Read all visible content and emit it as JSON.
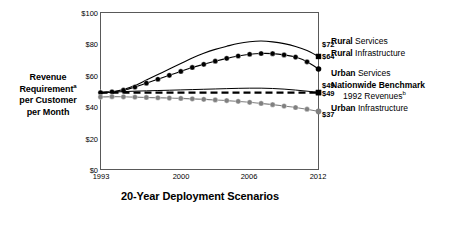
{
  "chart_data": {
    "type": "line",
    "title": "20-Year Deployment Scenarios",
    "xlabel": "20-Year Deployment Scenarios",
    "ylabel": "Revenue Requirement per Customer per Month",
    "ylabel_line1": "Revenue",
    "ylabel_line2": "Requirement",
    "ylabel_line2_sup": "a",
    "ylabel_line3": "per Customer",
    "ylabel_line4": "per Month",
    "grid": false,
    "legend_position": "right",
    "ylim": [
      0,
      100
    ],
    "ytick_labels": [
      "$100",
      "$80",
      "$60",
      "$40",
      "$20",
      "$0"
    ],
    "ytick_values": [
      100,
      80,
      60,
      40,
      20,
      0
    ],
    "xlim": [
      1993,
      2012
    ],
    "xtick_labels": [
      "1993",
      "2000",
      "2006",
      "2012"
    ],
    "xtick_values": [
      1993,
      2000,
      2006,
      2012
    ],
    "x": [
      1993,
      1994,
      1995,
      1996,
      1997,
      1998,
      1999,
      2000,
      2001,
      2002,
      2003,
      2004,
      2005,
      2006,
      2007,
      2008,
      2009,
      2010,
      2011,
      2012
    ],
    "series": [
      {
        "name": "Rural Services",
        "color": "#000000",
        "marker": "none",
        "end_marker": "square",
        "line_style": "solid",
        "line_width": 1.1,
        "end_label": "$72",
        "end_value": 72,
        "values": [
          49,
          49.5,
          51,
          53.5,
          57,
          60.5,
          64,
          67.5,
          71,
          74,
          76.5,
          78.5,
          80.3,
          81.4,
          81.8,
          81.3,
          80.2,
          78.4,
          75.8,
          72
        ]
      },
      {
        "name": "Rural Infrastructure",
        "color": "#000000",
        "marker": "circle",
        "end_marker": "circle",
        "line_style": "solid",
        "line_width": 1.1,
        "end_label": "$64",
        "end_value": 64,
        "values": [
          49,
          49.5,
          50.5,
          52.5,
          55,
          57.5,
          60,
          62.5,
          65,
          67,
          69,
          70.8,
          72.3,
          73.4,
          73.9,
          73.8,
          73,
          71.6,
          68.6,
          64
        ]
      },
      {
        "name": "Urban Services",
        "color": "#000000",
        "marker": "none",
        "end_marker": "square",
        "line_style": "solid",
        "line_width": 1.0,
        "end_label": "$49",
        "end_value": 49,
        "values": [
          48.6,
          49.2,
          49.6,
          49.9,
          50.1,
          50.3,
          50.5,
          50.7,
          50.9,
          51.1,
          51.3,
          51.5,
          51.7,
          51.8,
          51.8,
          51.6,
          51.2,
          50.6,
          49.9,
          49
        ]
      },
      {
        "name": "Nationwide Benchmark 1992 Revenues",
        "color": "#000000",
        "marker": "none",
        "end_marker": "square",
        "line_style": "dashed",
        "line_width": 2.2,
        "end_label": "$49",
        "end_value": 49,
        "values": [
          49,
          49,
          49,
          49,
          49,
          49,
          49,
          49,
          49,
          49,
          49,
          49,
          49,
          49,
          49,
          49,
          49,
          49,
          49,
          49
        ]
      },
      {
        "name": "Urban Infrastructure",
        "color": "#808080",
        "marker": "circle",
        "end_marker": "circle",
        "line_style": "solid",
        "line_width": 1.1,
        "end_label": "$37",
        "end_value": 37,
        "values": [
          46.2,
          46.4,
          46.3,
          46.1,
          45.9,
          45.7,
          45.5,
          45.3,
          45.0,
          44.7,
          44.3,
          43.9,
          43.4,
          42.8,
          42.1,
          41.3,
          40.4,
          39.5,
          38.4,
          37.0
        ]
      }
    ],
    "value_labels": [
      "$72",
      "$64",
      "$49",
      "$49",
      "$37"
    ],
    "legend_entries": [
      {
        "bold_part": "Rural",
        "rest": " Services",
        "indent": false,
        "gap_before": false,
        "all_bold": false
      },
      {
        "bold_part": "Rural",
        "rest": " Infrastructure",
        "indent": false,
        "gap_before": false,
        "all_bold": false
      },
      {
        "bold_part": "Urban",
        "rest": " Services",
        "indent": false,
        "gap_before": true,
        "all_bold": false
      },
      {
        "bold_part": "Nationwide Benchmark",
        "rest": "",
        "indent": false,
        "gap_before": false,
        "all_bold": true
      },
      {
        "bold_part": "1992 Revenues",
        "rest": "",
        "sup": "b",
        "indent": true,
        "gap_before": false,
        "all_bold": false
      },
      {
        "bold_part": "Urban",
        "rest": " Infrastructure",
        "indent": false,
        "gap_before": false,
        "all_bold": false
      }
    ]
  },
  "legend": {
    "l0": "Rural",
    "l0b": " Services",
    "l1": "Rural",
    "l1b": " Infrastructure",
    "l2": "Urban",
    "l2b": " Services",
    "l3": "Nationwide Benchmark",
    "l4": "1992 Revenues",
    "l4sup": "b",
    "l5": "Urban",
    "l5b": " Infrastructure"
  },
  "axis": {
    "y_label_1": "Revenue",
    "y_label_2": "Requirement",
    "y_label_2_sup": "a",
    "y_label_3": "per Customer",
    "y_label_4": "per Month",
    "title": "20-Year Deployment Scenarios"
  },
  "colors": {
    "line_black": "#000000",
    "line_gray": "#808080",
    "frame": "#595959",
    "background": "#ffffff"
  }
}
